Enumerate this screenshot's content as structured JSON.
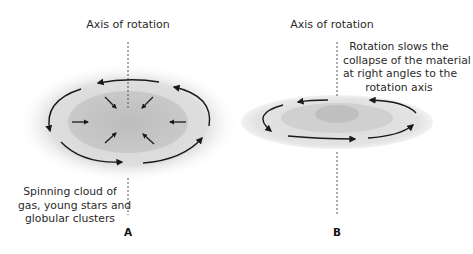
{
  "panels": [
    {
      "id": "A",
      "letter": "A",
      "axis_label": "Axis of rotation",
      "caption_lines": [
        "Spinning cloud of",
        "gas, young stars and",
        "globular clusters"
      ]
    },
    {
      "id": "B",
      "letter": "B",
      "axis_label": "Axis of rotation",
      "caption_lines": [
        "Rotation slows the",
        "collapse of the material",
        "at right angles to the",
        "rotation axis"
      ]
    }
  ],
  "colors": {
    "outer_glow": "#e6e6e6",
    "inner_core": "#c8c8c8",
    "disk_outer": "#e2e2e2",
    "disk_mid": "#d0d0d0",
    "disk_bulge": "#bdbdbd",
    "arrow": "#1a1a1a"
  }
}
